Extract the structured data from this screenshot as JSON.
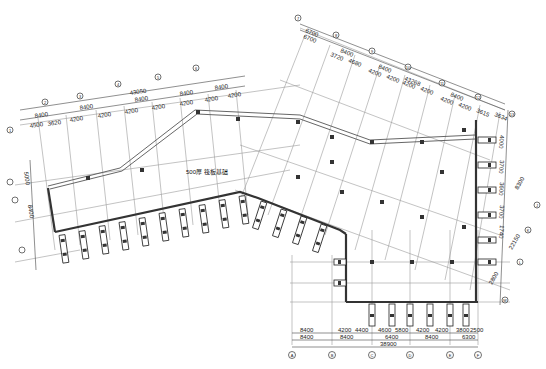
{
  "drawing": {
    "title_label": "500厚  筏板基础",
    "left_wing": {
      "overall_dim": "43050",
      "bay_dims_top": [
        "8400",
        "8400",
        "8400",
        "8400",
        "8400"
      ],
      "bay_dims_bottom": [
        "4500",
        "3620",
        "4200",
        "4200",
        "4200",
        "4200",
        "4200",
        "4200",
        "4200",
        "4200",
        "4200"
      ],
      "side_dims": [
        "5000",
        "8400"
      ]
    },
    "right_wing": {
      "overall_dim": "43268",
      "bay_dims_top": [
        "6700",
        "8400",
        "8400",
        "8400",
        "8400",
        "8400"
      ],
      "bay_dims_bottom": [
        "6700",
        "3720",
        "4680",
        "4200",
        "4200",
        "4200",
        "4200",
        "4200",
        "4200",
        "3615",
        "3634"
      ],
      "side_dims": [
        "4000",
        "3700",
        "3600",
        "3700",
        "1740",
        "4200",
        "2800"
      ],
      "side_overall": "8300",
      "side_overall_2": "22150"
    },
    "bottom": {
      "dims_row1": [
        "8400",
        "4200",
        "4400",
        "4600",
        "5800",
        "4200",
        "4200",
        "3800",
        "2500"
      ],
      "dims_row2": [
        "8400",
        "8400",
        "6400",
        "8400",
        "6300"
      ],
      "overall_dim": "38900",
      "axis_labels": [
        "A",
        "B",
        "C",
        "D",
        "E",
        "F"
      ]
    },
    "axis_labels_left": [
      "1",
      "2",
      "3",
      "4",
      "5",
      "6"
    ],
    "axis_labels_right": [
      "7",
      "8",
      "9",
      "10",
      "11",
      "12",
      "13"
    ],
    "axis_labels_side": [
      "J",
      "K",
      "L",
      "M"
    ]
  }
}
